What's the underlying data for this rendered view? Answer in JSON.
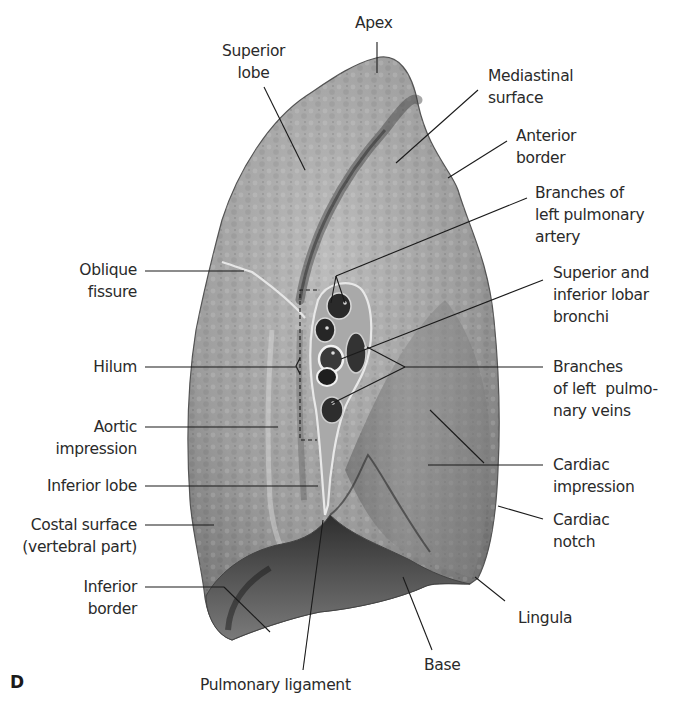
{
  "figure": {
    "panel_letter": "D",
    "colors": {
      "background": "#ffffff",
      "lung_light": "#b9b9b9",
      "lung_mid": "#8f8f8f",
      "lung_dark": "#3a3a3a",
      "leader_line": "#1a1a1a",
      "label_text": "#2a2a2a"
    }
  },
  "labels": {
    "apex": "Apex",
    "superior_lobe": "Superior\nlobe",
    "mediastinal_surface": "Mediastinal\nsurface",
    "anterior_border": "Anterior\nborder",
    "branches_left_pulmonary_artery": "Branches of\nleft pulmonary\nartery",
    "oblique_fissure": "Oblique\nfissure",
    "superior_inferior_lobar_bronchi": "Superior and\ninferior lobar\nbronchi",
    "hilum": "Hilum",
    "branches_left_pulmonary_veins": "Branches\nof left  pulmo-\nnary veins",
    "aortic_impression": "Aortic\nimpression",
    "cardiac_impression": "Cardiac\nimpression",
    "inferior_lobe": "Inferior lobe",
    "costal_surface": "Costal surface\n(vertebral part)",
    "cardiac_notch": "Cardiac\nnotch",
    "inferior_border": "Inferior\nborder",
    "lingula": "Lingula",
    "base": "Base",
    "pulmonary_ligament": "Pulmonary ligament"
  }
}
